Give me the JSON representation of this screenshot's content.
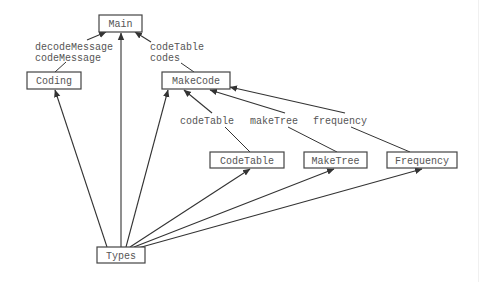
{
  "diagram": {
    "type": "module-dependency-graph",
    "nodes": [
      {
        "id": "main",
        "label": "Main",
        "x": 99,
        "y": 15,
        "w": 43,
        "h": 17
      },
      {
        "id": "coding",
        "label": "Coding",
        "x": 27,
        "y": 72,
        "w": 54,
        "h": 17
      },
      {
        "id": "makecode",
        "label": "MakeCode",
        "x": 162,
        "y": 72,
        "w": 68,
        "h": 17
      },
      {
        "id": "codetable",
        "label": "CodeTable",
        "x": 210,
        "y": 152,
        "w": 74,
        "h": 16
      },
      {
        "id": "maketree",
        "label": "MakeTree",
        "x": 304,
        "y": 152,
        "w": 63,
        "h": 16
      },
      {
        "id": "frequency",
        "label": "Frequency",
        "x": 387,
        "y": 152,
        "w": 70,
        "h": 16
      },
      {
        "id": "types",
        "label": "Types",
        "x": 97,
        "y": 247,
        "w": 48,
        "h": 16
      }
    ],
    "edges": [
      {
        "from": "coding",
        "to": "main",
        "labels": [
          "decodeMessage",
          "codeMessage"
        ]
      },
      {
        "from": "types",
        "to": "main",
        "labels": []
      },
      {
        "from": "makecode",
        "to": "main",
        "labels": [
          "codeTable",
          "codes"
        ]
      },
      {
        "from": "types",
        "to": "coding",
        "labels": []
      },
      {
        "from": "types",
        "to": "makecode",
        "labels": []
      },
      {
        "from": "codetable",
        "to": "makecode",
        "labels": [
          "codeTable"
        ]
      },
      {
        "from": "maketree",
        "to": "makecode",
        "labels": [
          "makeTree"
        ]
      },
      {
        "from": "frequency",
        "to": "makecode",
        "labels": [
          "frequency"
        ]
      },
      {
        "from": "types",
        "to": "codetable",
        "labels": []
      },
      {
        "from": "types",
        "to": "maketree",
        "labels": []
      },
      {
        "from": "types",
        "to": "frequency",
        "labels": []
      }
    ],
    "edge_labels": {
      "coding_main_1": "decodeMessage",
      "coding_main_2": "codeMessage",
      "makecode_main_1": "codeTable",
      "makecode_main_2": "codes",
      "codetable_makecode": "codeTable",
      "maketree_makecode": "makeTree",
      "frequency_makecode": "frequency"
    },
    "colors": {
      "stroke": "#333333",
      "text": "#555555",
      "background": "#ffffff"
    }
  }
}
